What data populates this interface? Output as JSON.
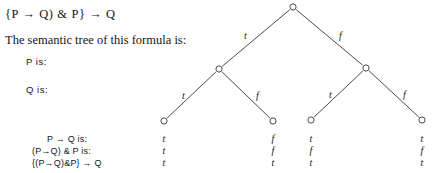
{
  "formula": {
    "text": "{P → Q) & P} → Q"
  },
  "caption": {
    "text": "The semantic tree of this formula is:"
  },
  "variables": [
    {
      "label": "P is:"
    },
    {
      "label": "Q is:"
    }
  ],
  "row_labels": [
    {
      "label": "P → Q is:"
    },
    {
      "label": "(P→Q) & P is:"
    },
    {
      "label": "{(P→Q)&P} → Q"
    }
  ],
  "tree": {
    "node_glyph": "o",
    "stroke_color": "#2b2b2b",
    "nodes": [
      {
        "id": "root",
        "x": 293,
        "y": 7,
        "level": 0
      },
      {
        "id": "p-t",
        "x": 219,
        "y": 69,
        "level": 1
      },
      {
        "id": "p-f",
        "x": 366,
        "y": 68,
        "level": 1
      },
      {
        "id": "tt",
        "x": 164,
        "y": 121,
        "level": 2
      },
      {
        "id": "tf",
        "x": 273,
        "y": 121,
        "level": 2
      },
      {
        "id": "ft",
        "x": 311,
        "y": 120,
        "level": 2
      },
      {
        "id": "ff",
        "x": 422,
        "y": 120,
        "level": 2
      }
    ],
    "edges": [
      {
        "from": "root",
        "to": "p-t",
        "label": "t",
        "label_x": 244,
        "label_y": 30
      },
      {
        "from": "root",
        "to": "p-f",
        "label": "f",
        "label_x": 339,
        "label_y": 30
      },
      {
        "from": "p-t",
        "to": "tt",
        "label": "t",
        "label_x": 182,
        "label_y": 90
      },
      {
        "from": "p-t",
        "to": "tf",
        "label": "f",
        "label_x": 256,
        "label_y": 90
      },
      {
        "from": "p-f",
        "to": "ft",
        "label": "t",
        "label_x": 329,
        "label_y": 89
      },
      {
        "from": "p-f",
        "to": "ff",
        "label": "f",
        "label_x": 403,
        "label_y": 89
      }
    ]
  },
  "truth_table": {
    "columns_x": [
      158,
      267,
      305,
      416
    ],
    "rows_y": [
      133,
      145,
      157
    ],
    "rows": [
      {
        "label": "P → Q is:",
        "values": [
          "t",
          "f",
          "t",
          "t"
        ]
      },
      {
        "label": "(P→Q) & P is:",
        "values": [
          "t",
          "f",
          "f",
          "f"
        ]
      },
      {
        "label": "{(P→Q)&P} → Q",
        "values": [
          "t",
          "t",
          "t",
          "t"
        ]
      }
    ]
  }
}
